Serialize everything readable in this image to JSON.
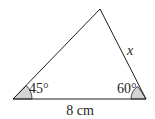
{
  "diagram": {
    "type": "triangle",
    "vertices": {
      "left": [
        13,
        99
      ],
      "right": [
        146,
        99
      ],
      "apex": [
        100,
        9
      ]
    },
    "angles": {
      "left": {
        "label": "45°",
        "value": 45
      },
      "right": {
        "label": "60°",
        "value": 60
      }
    },
    "sides": {
      "base": {
        "label": "8 cm"
      },
      "right": {
        "label": "x"
      }
    },
    "colors": {
      "stroke": "#231f20",
      "angle_fill": "#d1d3d4",
      "background": "#ffffff"
    }
  }
}
